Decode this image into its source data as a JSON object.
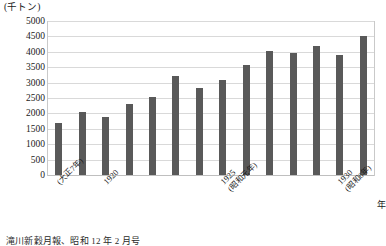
{
  "chart_data": {
    "type": "bar",
    "title": "",
    "subtitle": "",
    "unit_label": "(千トン)",
    "xlabel": "年",
    "ylabel": "",
    "ylim": [
      0,
      5000
    ],
    "ytick_step": 500,
    "ytick_labels": [
      "5000",
      "4500",
      "4000",
      "3500",
      "3000",
      "2500",
      "2000",
      "1500",
      "1000",
      "500",
      "0"
    ],
    "grid": true,
    "legend": null,
    "bar_color": "#595959",
    "gridline_color": "#d9d9d9",
    "categories": [
      "1918",
      "1919",
      "1920",
      "1921",
      "1922",
      "1923",
      "1924",
      "1925",
      "1926",
      "1927",
      "1928",
      "1929",
      "1930",
      "1931"
    ],
    "values": [
      1700,
      2060,
      1880,
      2300,
      2530,
      3200,
      2830,
      3080,
      3570,
      4020,
      3960,
      4180,
      3900,
      4500
    ],
    "xtick_labels": [
      {
        "index": 0,
        "main": "",
        "sub": "(大正7年)"
      },
      {
        "index": 2,
        "main": "1920",
        "sub": ""
      },
      {
        "index": 7,
        "main": "1925",
        "sub": "(昭和元年)"
      },
      {
        "index": 12,
        "main": "1930",
        "sub": "(昭和6年)"
      }
    ]
  },
  "caption": {
    "text": "滝川新穀月報、昭和 12 年 2 月号"
  }
}
